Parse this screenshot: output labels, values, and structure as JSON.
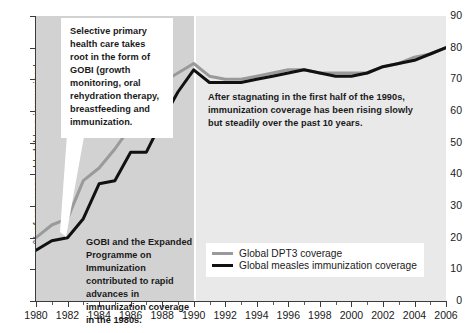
{
  "chart_data": {
    "type": "line",
    "title": "",
    "xlabel": "",
    "ylabel": "% of one-year-old children immunized",
    "xlim": [
      1980,
      2006
    ],
    "ylim": [
      0,
      90
    ],
    "grid": false,
    "legend_position": "bottom-center",
    "x": [
      1980,
      1981,
      1982,
      1983,
      1984,
      1985,
      1986,
      1987,
      1988,
      1989,
      1990,
      1991,
      1992,
      1993,
      1994,
      1995,
      1996,
      1997,
      1998,
      1999,
      2000,
      2001,
      2002,
      2003,
      2004,
      2005,
      2006
    ],
    "x_tick_labels": [
      "1980",
      "1982",
      "1984",
      "1986",
      "1988",
      "1990",
      "1992",
      "1994",
      "1996",
      "1998",
      "2000",
      "2002",
      "2004",
      "2006"
    ],
    "y_tick_labels": [
      "0",
      "10",
      "20",
      "30",
      "40",
      "50",
      "60",
      "70",
      "80",
      "90"
    ],
    "series": [
      {
        "name": "Global DPT3 coverage",
        "color": "#9a9a9a",
        "values": [
          20,
          24,
          26,
          38,
          42,
          48,
          55,
          61,
          69,
          72,
          75,
          71,
          70,
          70,
          71,
          72,
          73,
          73,
          72,
          72,
          72,
          72,
          74,
          75,
          77,
          78,
          80
        ]
      },
      {
        "name": "Global measles immunization coverage",
        "color": "#111111",
        "values": [
          16,
          19,
          20,
          26,
          37,
          38,
          47,
          47,
          57,
          66,
          73,
          69,
          69,
          69,
          70,
          71,
          72,
          73,
          72,
          71,
          71,
          72,
          74,
          75,
          76,
          78,
          80
        ]
      }
    ],
    "shaded_bands": [
      {
        "name": "1980-1990",
        "from": 1980,
        "to": 1990,
        "color": "#d2d2d2"
      },
      {
        "name": "1990-2006",
        "from": 1990,
        "to": 2006,
        "color": "#e9e9e9"
      }
    ],
    "annotations": [
      {
        "name": "gobi-intro",
        "text": "Selective primary health care takes root in the form of GOBI (growth monitoring, oral rehydration therapy, breastfeeding and immunization."
      },
      {
        "name": "gobi-expanded",
        "text": "GOBI and the Expanded Programme on Immunization contributed to rapid advances in immunization coverage in the 1980s."
      },
      {
        "name": "stagnating",
        "text": "After stagnating in the first half of the 1990s, immunization coverage has been rising slowly but steadily over the past 10 years."
      }
    ]
  }
}
